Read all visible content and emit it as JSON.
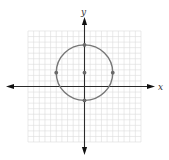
{
  "chart_data": {
    "type": "line",
    "title": "",
    "xlabel": "x",
    "ylabel": "y",
    "xlim": [
      -10,
      10
    ],
    "ylim": [
      -10,
      10
    ],
    "grid": true,
    "grid_step": 1,
    "series": [
      {
        "name": "circle",
        "shape": "circle",
        "center": [
          0,
          2.5
        ],
        "radius": 5
      }
    ],
    "points": [
      {
        "name": "center",
        "x": 0,
        "y": 2.5
      },
      {
        "name": "top",
        "x": 0,
        "y": 7.5
      },
      {
        "name": "bottom",
        "x": 0,
        "y": -2.5
      },
      {
        "name": "left",
        "x": -5,
        "y": 2.5
      },
      {
        "name": "right",
        "x": 5,
        "y": 2.5
      }
    ],
    "colors": {
      "curve": "#777777",
      "point": "#6a6a6a",
      "axis": "#2a2a2a",
      "grid": "#dcdcdc"
    }
  }
}
